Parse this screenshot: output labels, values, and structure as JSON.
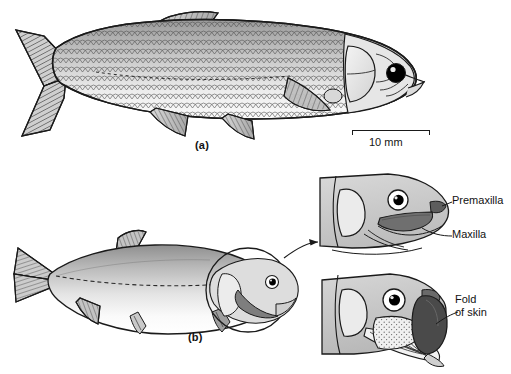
{
  "figure": {
    "background_color": "#ffffff",
    "width": 511,
    "height": 374
  },
  "panels": [
    {
      "id": "a",
      "label": "(a)",
      "description": "Lateral view of a scaled cyprinid-like fish with forked caudal fin, dorsal fin, pectoral and pelvic fins, large operculum and dark eye",
      "label_x": 195,
      "label_y": 139
    },
    {
      "id": "b",
      "label": "(b)",
      "description": "Lateral view of a smooth-bodied fish with dashed lateral line and circular magnifier callout over the head",
      "label_x": 188,
      "label_y": 331
    }
  ],
  "scale_bar": {
    "label": "10 mm",
    "x": 352,
    "y": 130,
    "width": 78,
    "tick_height": 5,
    "text_x": 369,
    "text_y": 134
  },
  "details": [
    {
      "id": "upper-head-detail",
      "description": "Head detail showing jaw bones with mouth closed",
      "annotations": [
        {
          "name": "premaxilla",
          "label": "Premaxilla",
          "x": 452,
          "y": 201
        },
        {
          "name": "maxilla",
          "label": "Maxilla",
          "x": 452,
          "y": 234
        }
      ]
    },
    {
      "id": "lower-head-detail",
      "description": "Head detail showing protruded jaw with expanded membrane",
      "annotations": [
        {
          "name": "fold-of-skin",
          "label": "Fold\nof skin",
          "x": 455,
          "y": 299
        }
      ]
    }
  ],
  "colors": {
    "outline": "#1a1a1a",
    "body_light": "#f2f2f2",
    "body_mid": "#bdbdbd",
    "body_dark": "#8a8a8a",
    "scale_fill": "#d2d2d2",
    "operculum": "#e8e8e8",
    "eye_black": "#000000",
    "maxilla_gray": "#6f6f6f",
    "fold_dark": "#4a4a4a",
    "text": "#121212"
  }
}
